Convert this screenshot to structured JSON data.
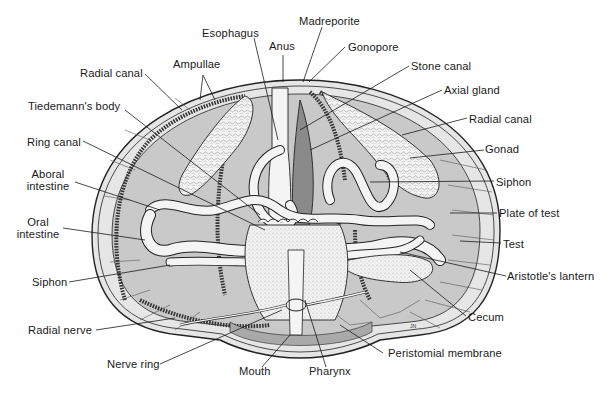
{
  "figure": {
    "signature": "JN"
  },
  "labels": {
    "madreporite": "Madreporite",
    "esophagus": "Esophagus",
    "anus": "Anus",
    "gonopore": "Gonopore",
    "ampullae": "Ampullae",
    "stone_canal": "Stone canal",
    "radial_canal_left": "Radial canal",
    "axial_gland": "Axial gland",
    "tiedemanns_body": "Tiedemann's body",
    "radial_canal_right": "Radial canal",
    "gonad": "Gonad",
    "ring_canal": "Ring canal",
    "aboral_intestine_1": "Aboral",
    "aboral_intestine_2": "intestine",
    "siphon_right": "Siphon",
    "oral_intestine_1": "Oral",
    "oral_intestine_2": "intestine",
    "plate_of_test": "Plate of test",
    "test": "Test",
    "siphon_left": "Siphon",
    "aristotles_lantern": "Aristotle's lantern",
    "cecum": "Cecum",
    "radial_nerve": "Radial nerve",
    "nerve_ring": "Nerve ring",
    "mouth": "Mouth",
    "pharynx": "Pharynx",
    "peristomial_membrane": "Peristomial membrane"
  },
  "colors": {
    "background": "#ffffff",
    "body_fill": "#c9c9c9",
    "test_band": "#e6e6e6",
    "organ_fill": "#f4f4f4",
    "gonad_fill": "#eeeeee",
    "axial_gland_fill": "#8a8a8a",
    "outline": "#222222",
    "label_text": "#1a1a1a"
  }
}
